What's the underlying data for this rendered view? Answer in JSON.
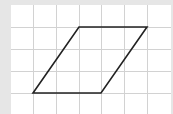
{
  "figure": {
    "type": "grid-diagram",
    "shape": "parallelogram",
    "background_color": "#e6e6e6",
    "panel_color": "#ffffff",
    "grid_color": "#d2d2d2",
    "shape_stroke_color": "#222222",
    "grid": {
      "columns": 7,
      "rows": 5,
      "vertical_lines_x": [
        33,
        56,
        79,
        101,
        124,
        147
      ],
      "horizontal_lines_y": [
        27,
        49,
        71,
        93
      ]
    },
    "vertices_grid_units": [
      {
        "label": "top-left",
        "col": 3,
        "row": 1
      },
      {
        "label": "top-right",
        "col": 6,
        "row": 1
      },
      {
        "label": "bottom-right",
        "col": 4,
        "row": 4
      },
      {
        "label": "bottom-left",
        "col": 1,
        "row": 4
      }
    ]
  }
}
